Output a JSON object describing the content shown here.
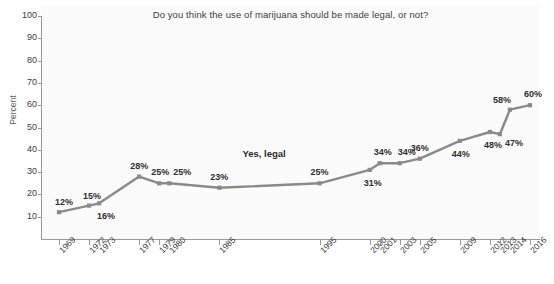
{
  "chart_data": {
    "type": "line",
    "title": "Do you think the use of marijuana should be made legal, or not?",
    "xlabel": "",
    "ylabel": "Percent",
    "ylim": [
      0,
      100
    ],
    "yticks": [
      10,
      20,
      30,
      40,
      50,
      60,
      70,
      80,
      90,
      100
    ],
    "grid": false,
    "legend_position": "none",
    "annotations": [
      {
        "text": "Yes, legal",
        "x": "1990",
        "y": 38
      }
    ],
    "categories": [
      "1969",
      "1972",
      "1973",
      "1977",
      "1979",
      "1980",
      "1985",
      "1995",
      "2000",
      "2001",
      "2003",
      "2005",
      "2009",
      "2012",
      "2013",
      "2014",
      "2016"
    ],
    "series": [
      {
        "name": "Yes, legal",
        "color": "#8a8a8a",
        "values": [
          12,
          15,
          16,
          28,
          25,
          25,
          23,
          25,
          31,
          34,
          34,
          36,
          44,
          48,
          47,
          58,
          60
        ],
        "data_labels": [
          "12%",
          "15%",
          "16%",
          "28%",
          "25%",
          "25%",
          "23%",
          "25%",
          "31%",
          "34%",
          "34%",
          "36%",
          "44%",
          "48%",
          "47%",
          "58%",
          "60%"
        ]
      }
    ]
  },
  "axes": {
    "y_tick_labels": [
      "100",
      "90",
      "80",
      "70",
      "60",
      "50",
      "40",
      "30",
      "20",
      "10"
    ],
    "x_tick_labels": [
      "1969",
      "1972",
      "1973",
      "1977",
      "1979",
      "1980",
      "1985",
      "1995",
      "2000",
      "2001",
      "2003",
      "2005",
      "2009",
      "2012",
      "2013",
      "2014",
      "2016"
    ]
  },
  "colors": {
    "line": "#8a8a8a",
    "axis": "#9a9a9a",
    "text": "#3b3b3b",
    "panel": "#fbfbfb",
    "page": "#ffffff"
  }
}
